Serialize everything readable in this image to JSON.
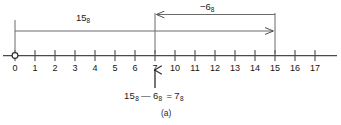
{
  "figure": {
    "caption": "(a)",
    "equation": "15₈ — 6₈  = 7₈",
    "equation_parts": {
      "minuend": "15",
      "minuend_base": "8",
      "operator": "—",
      "subtrahend": "6",
      "subtrahend_base": "8",
      "equals": "=",
      "result": "7",
      "result_base": "8"
    },
    "origin_marker": "open-circle",
    "axis": {
      "type": "number-line",
      "base": 8,
      "tick_labels": [
        "0",
        "1",
        "2",
        "3",
        "4",
        "5",
        "6",
        "7",
        "10",
        "11",
        "12",
        "13",
        "14",
        "15",
        "16",
        "17"
      ],
      "tick_values": [
        0,
        1,
        2,
        3,
        4,
        5,
        6,
        7,
        8,
        9,
        10,
        11,
        12,
        13,
        14,
        15
      ]
    },
    "measurements": [
      {
        "name": "total-span",
        "label": "15",
        "label_base": "8",
        "from_tick": "0",
        "to_tick": "15",
        "direction": "right",
        "arrowhead": "end"
      },
      {
        "name": "subtraction-span",
        "label": "−6",
        "label_base": "8",
        "from_tick": "15",
        "to_tick": "7",
        "direction": "left",
        "arrowhead": "start"
      }
    ],
    "result_pointer": {
      "name": "result-arrow",
      "points_to_tick": "7",
      "direction": "up"
    },
    "colors": {
      "ink": "#1a1a1a",
      "line": "#4a4a4a",
      "background": "#ffffff"
    }
  }
}
